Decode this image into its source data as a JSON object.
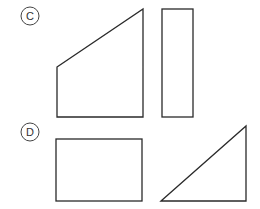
{
  "options": [
    {
      "label": "C",
      "shapes": [
        {
          "type": "trapezoid",
          "description": "quadrilateral with slanted top edge"
        },
        {
          "type": "rectangle",
          "description": "tall narrow rectangle"
        }
      ]
    },
    {
      "label": "D",
      "shapes": [
        {
          "type": "rectangle",
          "description": "wide rectangle"
        },
        {
          "type": "right-triangle",
          "description": "right triangle with right angle at bottom-right"
        }
      ]
    }
  ],
  "colors": {
    "stroke": "#2a2a2a",
    "background": "#ffffff"
  }
}
